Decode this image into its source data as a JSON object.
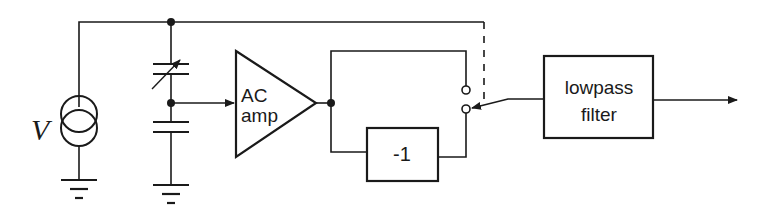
{
  "diagram": {
    "type": "block-diagram",
    "colors": {
      "stroke": "#1a1a1a",
      "background": "#ffffff"
    },
    "source": {
      "label": "V",
      "symbol": "current-source"
    },
    "components": [
      {
        "id": "variable-capacitor",
        "symbol": "variable-capacitor"
      },
      {
        "id": "fixed-capacitor",
        "symbol": "capacitor"
      },
      {
        "id": "ac-amp",
        "symbol": "amplifier",
        "label_line1": "AC",
        "label_line2": "amp"
      },
      {
        "id": "inverter",
        "symbol": "block",
        "label": "-1"
      },
      {
        "id": "switch",
        "symbol": "spdt-switch"
      },
      {
        "id": "lowpass-filter",
        "symbol": "block",
        "label_line1": "lowpass",
        "label_line2": "filter"
      }
    ],
    "grounds": 2
  }
}
